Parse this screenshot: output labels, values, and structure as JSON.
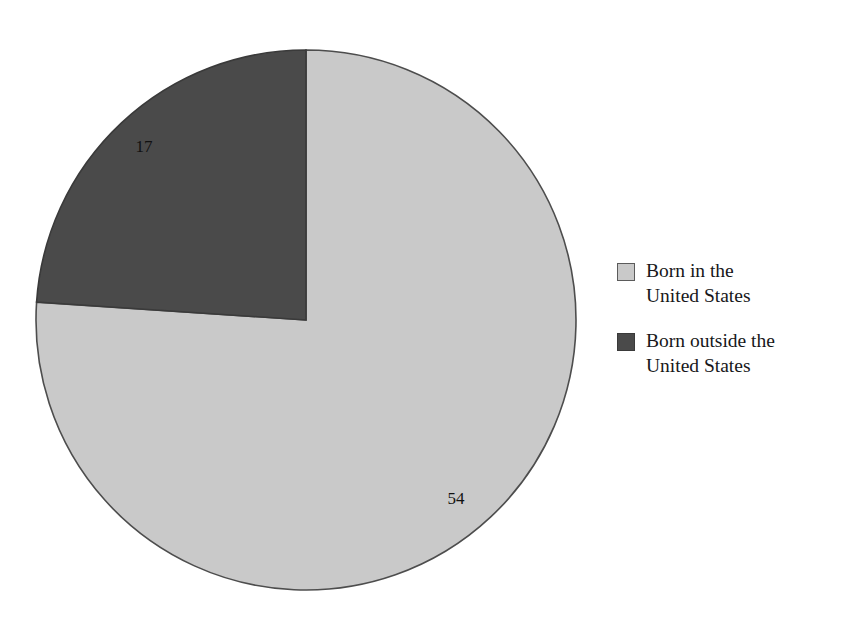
{
  "chart_data": {
    "type": "pie",
    "title": "",
    "subtitle": "",
    "xlabel": "",
    "ylabel": "",
    "grid": false,
    "legend_position": "right",
    "start_angle_deg": 0,
    "direction": "clockwise",
    "total": 71,
    "center": {
      "x": 306,
      "y": 320
    },
    "radius": 270,
    "categories": [
      "Born in the United States",
      "Born outside the United States"
    ],
    "values": [
      54,
      17
    ],
    "slices": [
      {
        "label": "Born in the United States",
        "value": 54,
        "value_text": "54",
        "color": "#c9c9c9",
        "stroke": "#4d4d4d",
        "start_deg": 0,
        "sweep_deg": 273.8,
        "label_x": 456,
        "label_y": 500
      },
      {
        "label": "Born outside the United States",
        "value": 17,
        "value_text": "17",
        "color": "#4a4a4a",
        "stroke": "#3a3a3a",
        "start_deg": 273.8,
        "sweep_deg": 86.2,
        "label_x": 144,
        "label_y": 148
      }
    ]
  },
  "legend": {
    "items": [
      {
        "label": "Born in the\nUnited States",
        "color": "#c9c9c9",
        "border": "#5b5b5b"
      },
      {
        "label": "Born outside the\nUnited States",
        "color": "#4a4a4a",
        "border": "#3a3a3a"
      }
    ]
  },
  "colors": {
    "background": "#ffffff",
    "series_light": "#c9c9c9",
    "series_dark": "#4a4a4a",
    "outline": "#4d4d4d",
    "text": "#17171a"
  }
}
